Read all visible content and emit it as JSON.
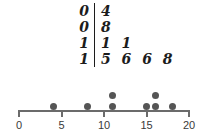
{
  "figure": {
    "background_color": "#ffffff",
    "ink_color": "#1c1c1c",
    "dot_color": "#555555",
    "axis_color": "#6b6b6b"
  },
  "stem_leaf": {
    "type": "stem-and-leaf",
    "divider": "|",
    "rows": [
      {
        "stem": "0",
        "leaves": "4"
      },
      {
        "stem": "0",
        "leaves": "8"
      },
      {
        "stem": "1",
        "leaves": "1 1"
      },
      {
        "stem": "1",
        "leaves": "5 6 6 8"
      }
    ]
  },
  "chart_data": {
    "type": "scatter",
    "title": "",
    "xlabel": "",
    "ylabel": "",
    "xlim": [
      0,
      20
    ],
    "grid": false,
    "legend": null,
    "tick_labels": [
      "0",
      "5",
      "10",
      "15",
      "20"
    ],
    "tick_values": [
      0,
      5,
      10,
      15,
      20
    ],
    "values": [
      4,
      8,
      11,
      11,
      15,
      16,
      16,
      18
    ],
    "dots": [
      {
        "value": 4,
        "stack": 1
      },
      {
        "value": 8,
        "stack": 1
      },
      {
        "value": 11,
        "stack": 1
      },
      {
        "value": 11,
        "stack": 2
      },
      {
        "value": 15,
        "stack": 1
      },
      {
        "value": 16,
        "stack": 1
      },
      {
        "value": 16,
        "stack": 2
      },
      {
        "value": 18,
        "stack": 1
      }
    ]
  }
}
